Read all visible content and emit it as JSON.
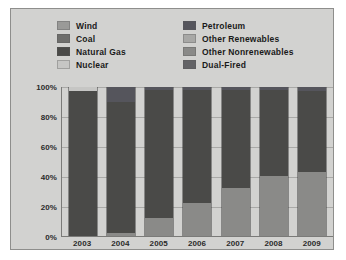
{
  "legend": {
    "left_column": [
      {
        "label": "Wind",
        "color": "#9a9a98"
      },
      {
        "label": "Coal",
        "color": "#6e6e6c"
      },
      {
        "label": "Natural Gas",
        "color": "#4a4a48"
      },
      {
        "label": "Nuclear",
        "color": "#c6c6c4"
      }
    ],
    "right_column": [
      {
        "label": "Petroleum",
        "color": "#55555c"
      },
      {
        "label": "Other Renewables",
        "color": "#a8a8a6"
      },
      {
        "label": "Other Nonrenewables",
        "color": "#8a8a88"
      },
      {
        "label": "Dual-Fired",
        "color": "#636366"
      }
    ]
  },
  "chart_data": {
    "type": "bar",
    "stacked": true,
    "normalized": true,
    "title": "",
    "xlabel": "",
    "ylabel": "",
    "ylim": [
      0,
      100
    ],
    "yticks": [
      "0%",
      "20%",
      "40%",
      "60%",
      "80%",
      "100%"
    ],
    "ytick_values": [
      0,
      20,
      40,
      60,
      80,
      100
    ],
    "grid": true,
    "legend_position": "top",
    "categories": [
      "2003",
      "2004",
      "2005",
      "2006",
      "2007",
      "2008",
      "2009"
    ],
    "series": [
      {
        "name": "Wind",
        "color": "#9a9a98",
        "values": [
          0,
          0,
          0,
          0,
          0,
          0,
          0
        ]
      },
      {
        "name": "Coal",
        "color": "#6e6e6c",
        "values": [
          0,
          0,
          0,
          0,
          0,
          0,
          0
        ]
      },
      {
        "name": "Natural Gas",
        "color": "#4a4a48",
        "values": [
          97,
          88,
          86,
          76,
          66,
          58,
          54
        ]
      },
      {
        "name": "Nuclear",
        "color": "#c6c6c4",
        "values": [
          3,
          0,
          0,
          0,
          0,
          0,
          0
        ]
      },
      {
        "name": "Petroleum",
        "color": "#55555c",
        "values": [
          0,
          10,
          2,
          2,
          2,
          2,
          3
        ]
      },
      {
        "name": "Other Renewables",
        "color": "#a8a8a6",
        "values": [
          0,
          0,
          0,
          0,
          0,
          0,
          0
        ]
      },
      {
        "name": "Other Nonrenewables",
        "color": "#8a8a88",
        "values": [
          0,
          2,
          12,
          22,
          32,
          40,
          43
        ]
      },
      {
        "name": "Dual-Fired",
        "color": "#636366",
        "values": [
          0,
          0,
          0,
          0,
          0,
          0,
          0
        ]
      }
    ],
    "stacks": [
      {
        "category": "2003",
        "segments": [
          {
            "name": "Nuclear",
            "value": 3,
            "color": "#c6c6c4"
          },
          {
            "name": "Natural Gas",
            "value": 97,
            "color": "#4a4a48"
          }
        ]
      },
      {
        "category": "2004",
        "segments": [
          {
            "name": "Petroleum",
            "value": 10,
            "color": "#55555c"
          },
          {
            "name": "Natural Gas",
            "value": 88,
            "color": "#4a4a48"
          },
          {
            "name": "Other Nonrenewables",
            "value": 2,
            "color": "#8a8a88"
          }
        ]
      },
      {
        "category": "2005",
        "segments": [
          {
            "name": "Petroleum",
            "value": 2,
            "color": "#55555c"
          },
          {
            "name": "Natural Gas",
            "value": 86,
            "color": "#4a4a48"
          },
          {
            "name": "Other Nonrenewables",
            "value": 12,
            "color": "#8a8a88"
          }
        ]
      },
      {
        "category": "2006",
        "segments": [
          {
            "name": "Petroleum",
            "value": 2,
            "color": "#55555c"
          },
          {
            "name": "Natural Gas",
            "value": 76,
            "color": "#4a4a48"
          },
          {
            "name": "Other Nonrenewables",
            "value": 22,
            "color": "#8a8a88"
          }
        ]
      },
      {
        "category": "2007",
        "segments": [
          {
            "name": "Petroleum",
            "value": 2,
            "color": "#55555c"
          },
          {
            "name": "Natural Gas",
            "value": 66,
            "color": "#4a4a48"
          },
          {
            "name": "Other Nonrenewables",
            "value": 32,
            "color": "#8a8a88"
          }
        ]
      },
      {
        "category": "2008",
        "segments": [
          {
            "name": "Petroleum",
            "value": 2,
            "color": "#55555c"
          },
          {
            "name": "Natural Gas",
            "value": 58,
            "color": "#4a4a48"
          },
          {
            "name": "Other Nonrenewables",
            "value": 40,
            "color": "#8a8a88"
          }
        ]
      },
      {
        "category": "2009",
        "segments": [
          {
            "name": "Petroleum",
            "value": 3,
            "color": "#55555c"
          },
          {
            "name": "Natural Gas",
            "value": 54,
            "color": "#4a4a48"
          },
          {
            "name": "Other Nonrenewables",
            "value": 43,
            "color": "#8a8a88"
          }
        ]
      }
    ]
  },
  "colors": {
    "panel_background": "#d2d2d0",
    "panel_border": "#8e8e8c",
    "axis": "#7a7a78",
    "grid": "#78787655",
    "text": "#1a1a1a"
  }
}
